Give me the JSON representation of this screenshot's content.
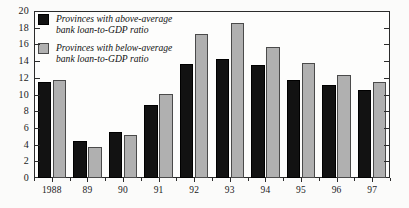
{
  "chart_data": {
    "type": "bar",
    "title": "",
    "xlabel": "",
    "ylabel": "",
    "ylim": [
      0,
      20
    ],
    "ytick_step": 2,
    "yticks": [
      0,
      2,
      4,
      6,
      8,
      10,
      12,
      14,
      16,
      18,
      20
    ],
    "grid": false,
    "legend_position": "top-left",
    "categories": [
      "1988",
      "89",
      "90",
      "91",
      "92",
      "93",
      "94",
      "95",
      "96",
      "97"
    ],
    "series": [
      {
        "name": "Provinces with above-average bank loan-to-GDP ratio",
        "color": "#121212",
        "values": [
          11.5,
          4.4,
          5.5,
          8.8,
          13.6,
          14.2,
          13.5,
          11.7,
          11.1,
          10.5
        ]
      },
      {
        "name": "Provinces with below-average bank loan-to-GDP ratio",
        "color": "#b0b0b0",
        "values": [
          11.7,
          3.7,
          5.1,
          10.1,
          17.2,
          18.6,
          15.7,
          13.8,
          12.3,
          11.5
        ]
      }
    ]
  },
  "legend": {
    "items": [
      {
        "label_line1": "Provinces with above-average",
        "label_line2": "bank loan-to-GDP ratio",
        "swatch": "above"
      },
      {
        "label_line1": "Provinces with below-average",
        "label_line2": "bank loan-to-GDP ratio",
        "swatch": "below"
      }
    ]
  },
  "colors": {
    "above_average_bar": "#121212",
    "below_average_bar": "#b0b0b0",
    "axis": "#2b2b2b",
    "background": "#fbfbfa"
  }
}
